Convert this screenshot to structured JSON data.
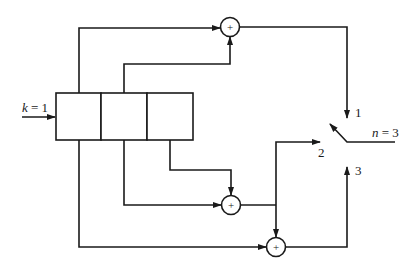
{
  "diagram": {
    "title": "",
    "input_label": "k = 1",
    "input_var": "k",
    "input_eq": " = 1",
    "commutator_label": "n = 3",
    "commutator_var": "n",
    "commutator_eq": " = 3",
    "register_cells": 3,
    "adders": [
      {
        "id": "adder-1",
        "symbol": "+"
      },
      {
        "id": "adder-2",
        "symbol": "+"
      },
      {
        "id": "adder-3",
        "symbol": "+"
      }
    ],
    "outputs": [
      {
        "id": "output-1",
        "label": "1"
      },
      {
        "id": "output-2",
        "label": "2"
      },
      {
        "id": "output-3",
        "label": "3"
      }
    ]
  }
}
